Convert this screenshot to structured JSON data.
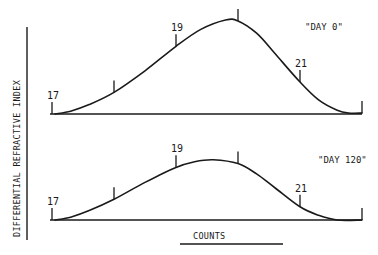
{
  "chart_data": {
    "type": "line",
    "ylabel": "DIFFERENTIAL REFRACTIVE INDEX",
    "xlabel": "COUNTS",
    "xlim": [
      17,
      22
    ],
    "ylim": [
      0,
      1.05
    ],
    "grid": false,
    "panels": [
      {
        "name": "\"DAY 0\"",
        "tick_labels": [
          {
            "x": 17,
            "label": "17"
          },
          {
            "x": 18,
            "label": ""
          },
          {
            "x": 19,
            "label": "19"
          },
          {
            "x": 20,
            "label": ""
          },
          {
            "x": 21,
            "label": "21"
          },
          {
            "x": 22,
            "label": ""
          }
        ],
        "series": {
          "x": [
            17.05,
            17.3,
            17.6,
            18.0,
            18.5,
            19.0,
            19.4,
            19.8,
            20.0,
            20.3,
            20.6,
            21.0,
            21.3,
            21.6,
            21.8,
            22.0
          ],
          "y": [
            0.0,
            0.03,
            0.1,
            0.23,
            0.46,
            0.72,
            0.9,
            1.0,
            0.99,
            0.86,
            0.64,
            0.34,
            0.15,
            0.04,
            0.01,
            0.01
          ]
        }
      },
      {
        "name": "\"DAY 120\"",
        "tick_labels": [
          {
            "x": 17,
            "label": "17"
          },
          {
            "x": 18,
            "label": ""
          },
          {
            "x": 19,
            "label": "19"
          },
          {
            "x": 20,
            "label": ""
          },
          {
            "x": 21,
            "label": "21"
          },
          {
            "x": 22,
            "label": ""
          }
        ],
        "series": {
          "x": [
            17.05,
            17.3,
            17.6,
            18.0,
            18.5,
            19.0,
            19.3,
            19.6,
            20.0,
            20.3,
            20.6,
            21.0,
            21.3,
            21.6,
            22.0
          ],
          "y": [
            0.0,
            0.03,
            0.1,
            0.22,
            0.4,
            0.56,
            0.62,
            0.64,
            0.6,
            0.49,
            0.34,
            0.14,
            0.05,
            0.0,
            0.0
          ]
        }
      }
    ]
  }
}
